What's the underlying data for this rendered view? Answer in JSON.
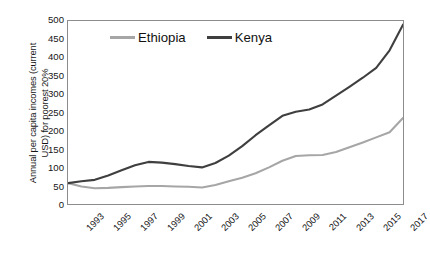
{
  "chart_data": {
    "type": "line",
    "title": "",
    "xlabel": "",
    "ylabel": "Annual per capita incomes (current USD) for poorest 20%",
    "ylabel_line1": "Annual per capita incomes (current",
    "ylabel_line2": "USD) for poorest 20%",
    "ylim": [
      0,
      500
    ],
    "ytick_step": 50,
    "yticks": [
      500,
      450,
      400,
      350,
      300,
      250,
      200,
      150,
      100,
      50,
      0
    ],
    "xlim": [
      1993,
      2018
    ],
    "grid": false,
    "legend_position": "top-center-inside",
    "x": [
      1993,
      1994,
      1995,
      1996,
      1997,
      1998,
      1999,
      2000,
      2001,
      2002,
      2003,
      2004,
      2005,
      2006,
      2007,
      2008,
      2009,
      2010,
      2011,
      2012,
      2013,
      2014,
      2015,
      2016,
      2017,
      2018
    ],
    "xtick_labels": [
      "1993",
      "1995",
      "1997",
      "1999",
      "2001",
      "2003",
      "2005",
      "2007",
      "2009",
      "2011",
      "2013",
      "2015",
      "2017"
    ],
    "xtick_values": [
      1993,
      1995,
      1997,
      1999,
      2001,
      2003,
      2005,
      2007,
      2009,
      2011,
      2013,
      2015,
      2017
    ],
    "series": [
      {
        "name": "Ethiopia",
        "color": "#a6a6a6",
        "values": [
          57,
          48,
          43,
          44,
          46,
          48,
          49,
          49,
          48,
          47,
          45,
          52,
          62,
          72,
          84,
          100,
          118,
          131,
          133,
          134,
          142,
          155,
          168,
          182,
          196,
          235
        ]
      },
      {
        "name": "Kenya",
        "color": "#3f3f3f",
        "values": [
          57,
          62,
          66,
          78,
          92,
          106,
          115,
          113,
          109,
          104,
          100,
          112,
          132,
          158,
          188,
          215,
          241,
          252,
          258,
          272,
          296,
          320,
          345,
          372,
          420,
          490
        ]
      }
    ]
  },
  "legend": {
    "items": [
      {
        "label": "Ethiopia",
        "color": "#a6a6a6"
      },
      {
        "label": "Kenya",
        "color": "#3f3f3f"
      }
    ]
  }
}
